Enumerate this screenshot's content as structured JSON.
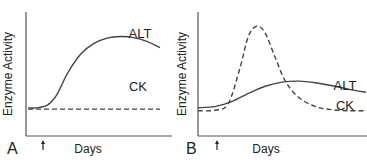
{
  "chart_data": [
    {
      "type": "line",
      "panel_label": "A",
      "xlabel": "Days",
      "ylabel": "Enzyme Activity",
      "xlim": [
        0,
        10
      ],
      "ylim": [
        0,
        10
      ],
      "arrow_marker_x": 1.2,
      "grid": false,
      "series": [
        {
          "name": "ALT",
          "style": "solid",
          "x": [
            0,
            0.8,
            1.5,
            2.2,
            3.0,
            4.0,
            5.0,
            6.0,
            7.0,
            8.0,
            9.0,
            10.0
          ],
          "y": [
            1.5,
            1.55,
            1.8,
            2.8,
            4.8,
            6.6,
            7.6,
            8.1,
            8.25,
            8.15,
            7.8,
            7.2
          ]
        },
        {
          "name": "CK",
          "style": "dashed",
          "x": [
            0,
            10
          ],
          "y": [
            1.4,
            1.4
          ]
        }
      ]
    },
    {
      "type": "line",
      "panel_label": "B",
      "xlabel": "Days",
      "ylabel": "Enzyme Activity",
      "xlim": [
        0,
        10
      ],
      "ylim": [
        0,
        10
      ],
      "arrow_marker_x": 1.3,
      "grid": false,
      "series": [
        {
          "name": "ALT",
          "style": "solid",
          "x": [
            0,
            1.0,
            2.0,
            3.0,
            4.0,
            5.0,
            6.0,
            7.0,
            8.0,
            9.0,
            10.0
          ],
          "y": [
            1.6,
            1.7,
            2.2,
            3.0,
            3.7,
            4.1,
            4.2,
            4.05,
            3.75,
            3.4,
            3.1
          ]
        },
        {
          "name": "CK",
          "style": "dashed",
          "x": [
            0,
            1.0,
            1.8,
            2.5,
            3.0,
            3.5,
            4.0,
            4.6,
            5.2,
            6.0,
            7.0,
            8.0,
            9.0,
            10.0
          ],
          "y": [
            1.3,
            1.35,
            2.0,
            5.5,
            8.6,
            9.6,
            8.9,
            6.5,
            4.2,
            2.6,
            1.7,
            1.4,
            1.3,
            1.3
          ]
        }
      ]
    }
  ]
}
